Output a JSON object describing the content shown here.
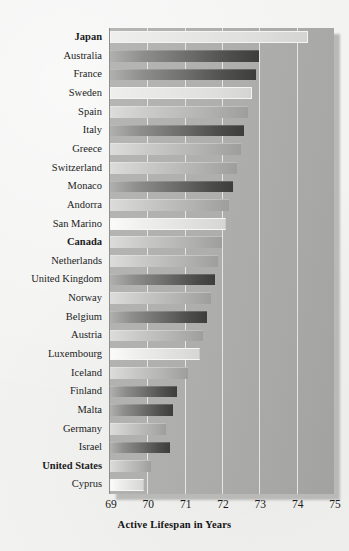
{
  "chart_data": {
    "type": "bar",
    "orientation": "horizontal",
    "title": "",
    "subtitle": "",
    "xlabel": "Active Lifespan in Years",
    "ylabel": "",
    "xlim": [
      69,
      75
    ],
    "xticks": [
      69,
      70,
      71,
      72,
      73,
      74,
      75
    ],
    "xtick_labels": [
      "69",
      "70",
      "71",
      "72",
      "73",
      "74",
      "75"
    ],
    "grid": true,
    "grid_axis": "x",
    "legend": null,
    "legend_position": "none",
    "categories": [
      "Japan",
      "Australia",
      "France",
      "Sweden",
      "Spain",
      "Italy",
      "Greece",
      "Switzerland",
      "Monaco",
      "Andorra",
      "San Marino",
      "Canada",
      "Netherlands",
      "United Kingdom",
      "Norway",
      "Belgium",
      "Austria",
      "Luxembourg",
      "Iceland",
      "Finland",
      "Malta",
      "Germany",
      "Israel",
      "United States",
      "Cyprus"
    ],
    "values": [
      74.3,
      73.0,
      72.9,
      72.8,
      72.7,
      72.6,
      72.5,
      72.4,
      72.3,
      72.2,
      72.1,
      72.0,
      71.9,
      71.8,
      71.7,
      71.6,
      71.5,
      71.4,
      71.1,
      70.8,
      70.7,
      70.5,
      70.6,
      70.1,
      69.9
    ],
    "emphasized_categories": [
      "Japan",
      "Canada",
      "United States"
    ],
    "bar_styles": [
      "pale",
      "dark",
      "dark",
      "pale",
      "mid",
      "dark",
      "mid",
      "mid",
      "dark",
      "mid",
      "light",
      "mid",
      "mid",
      "dark",
      "mid",
      "dark",
      "mid",
      "light",
      "mid",
      "dark",
      "dark",
      "mid",
      "dark",
      "mid",
      "light"
    ]
  },
  "colors": {
    "panel_background": "#aeaeac",
    "paper_background": "#f2f2f1",
    "gridline": "#f0f0ee",
    "text": "#1c1c1c",
    "bar_dark": "#4e4e4c",
    "bar_light": "#eeeeec"
  }
}
